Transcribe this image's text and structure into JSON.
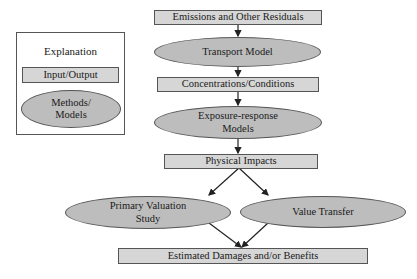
{
  "legend": {
    "title": "Explanation",
    "input_output_label": "Input/Output",
    "methods_label": "Methods/\nModels"
  },
  "nodes": {
    "emissions": "Emissions and Other Residuals",
    "transport": "Transport Model",
    "concentrations": "Concentrations/Conditions",
    "exposure": "Exposure-response\nModels",
    "physical": "Physical Impacts",
    "primary": "Primary Valuation\nStudy",
    "transfer": "Value Transfer",
    "estimated": "Estimated Damages and/or Benefits"
  },
  "colors": {
    "box_fill": "#d6d6d6",
    "ellipse_fill": "#bdbdbd",
    "border": "#555555"
  }
}
